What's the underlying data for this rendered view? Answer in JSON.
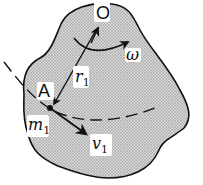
{
  "diagram": {
    "type": "rigid-body-rotation",
    "labels": {
      "pivot": "O",
      "angular_velocity": "ω",
      "point": "A",
      "radius": "r",
      "radius_sub": "1",
      "mass": "m",
      "mass_sub": "1",
      "velocity": "v",
      "velocity_sub": "1"
    },
    "colors": {
      "body_fill": "#bdbdbd",
      "outline": "#111111",
      "background": "#ffffff"
    }
  }
}
